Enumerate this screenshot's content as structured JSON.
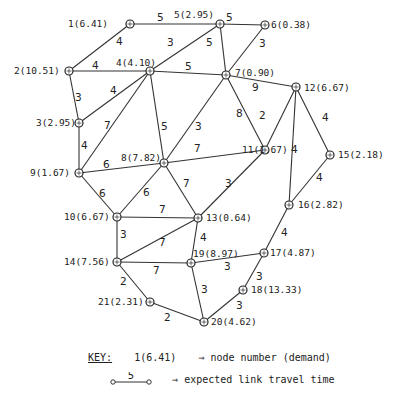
{
  "diagram": {
    "type": "network-graph",
    "nodes": [
      {
        "id": 1,
        "label": "1(6.41)",
        "demand": 6.41,
        "x": 130,
        "y": 24,
        "lx": 68,
        "ly": 27
      },
      {
        "id": 2,
        "label": "2(10.51)",
        "demand": 10.51,
        "x": 69,
        "y": 71,
        "lx": 14,
        "ly": 74
      },
      {
        "id": 3,
        "label": "3(2.95)",
        "demand": 2.95,
        "x": 79,
        "y": 123,
        "lx": 36,
        "ly": 126
      },
      {
        "id": 4,
        "label": "4(4.10)",
        "demand": 4.1,
        "x": 150,
        "y": 71,
        "lx": 116,
        "ly": 66
      },
      {
        "id": 5,
        "label": "5(2.95)",
        "demand": 2.95,
        "x": 220,
        "y": 24,
        "lx": 174,
        "ly": 18
      },
      {
        "id": 6,
        "label": "6(0.38)",
        "demand": 0.38,
        "x": 265,
        "y": 25,
        "lx": 271,
        "ly": 28
      },
      {
        "id": 7,
        "label": "7(0.90)",
        "demand": 0.9,
        "x": 226,
        "y": 75,
        "lx": 235,
        "ly": 76
      },
      {
        "id": 8,
        "label": "8(7.82)",
        "demand": 7.82,
        "x": 164,
        "y": 163,
        "lx": 121,
        "ly": 161
      },
      {
        "id": 9,
        "label": "9(1.67)",
        "demand": 1.67,
        "x": 79,
        "y": 173,
        "lx": 30,
        "ly": 176
      },
      {
        "id": 10,
        "label": "10(6.67)",
        "demand": 6.67,
        "x": 117,
        "y": 217,
        "lx": 64,
        "ly": 220
      },
      {
        "id": 11,
        "label": "11(1.67)",
        "demand": 1.67,
        "x": 265,
        "y": 150,
        "lx": 242,
        "ly": 153
      },
      {
        "id": 12,
        "label": "12(6.67)",
        "demand": 6.67,
        "x": 296,
        "y": 87,
        "lx": 304,
        "ly": 91
      },
      {
        "id": 13,
        "label": "13(0.64)",
        "demand": 0.64,
        "x": 198,
        "y": 218,
        "lx": 206,
        "ly": 221
      },
      {
        "id": 14,
        "label": "14(7.56)",
        "demand": 7.56,
        "x": 117,
        "y": 262,
        "lx": 64,
        "ly": 265
      },
      {
        "id": 15,
        "label": "15(2.18)",
        "demand": 2.18,
        "x": 330,
        "y": 155,
        "lx": 338,
        "ly": 158
      },
      {
        "id": 16,
        "label": "16(2.82)",
        "demand": 2.82,
        "x": 289,
        "y": 205,
        "lx": 298,
        "ly": 208
      },
      {
        "id": 17,
        "label": "17(4.87)",
        "demand": 4.87,
        "x": 264,
        "y": 253,
        "lx": 270,
        "ly": 256
      },
      {
        "id": 18,
        "label": "18(13.33)",
        "demand": 13.33,
        "x": 243,
        "y": 290,
        "lx": 251,
        "ly": 293
      },
      {
        "id": 19,
        "label": "19(8.97)",
        "demand": 8.97,
        "x": 191,
        "y": 263,
        "lx": 193,
        "ly": 257
      },
      {
        "id": 20,
        "label": "20(4.62)",
        "demand": 4.62,
        "x": 204,
        "y": 322,
        "lx": 211,
        "ly": 325
      },
      {
        "id": 21,
        "label": "21(2.31)",
        "demand": 2.31,
        "x": 150,
        "y": 302,
        "lx": 98,
        "ly": 305
      }
    ],
    "links": [
      {
        "from": 1,
        "to": 5,
        "time": 5,
        "tx": 157,
        "ty": 21
      },
      {
        "from": 1,
        "to": 2,
        "time": 4,
        "tx": 116,
        "ty": 45
      },
      {
        "from": 5,
        "to": 6,
        "time": 5,
        "tx": 226,
        "ty": 21
      },
      {
        "from": 5,
        "to": 4,
        "time": 3,
        "tx": 167,
        "ty": 46
      },
      {
        "from": 5,
        "to": 7,
        "time": 5,
        "tx": 206,
        "ty": 46
      },
      {
        "from": 6,
        "to": 7,
        "time": 3,
        "tx": 259,
        "ty": 47
      },
      {
        "from": 2,
        "to": 4,
        "time": 4,
        "tx": 92,
        "ty": 69
      },
      {
        "from": 4,
        "to": 7,
        "time": 5,
        "tx": 185,
        "ty": 70
      },
      {
        "from": 2,
        "to": 3,
        "time": 3,
        "tx": 75,
        "ty": 101
      },
      {
        "from": 4,
        "to": 3,
        "time": 4,
        "tx": 110,
        "ty": 94
      },
      {
        "from": 4,
        "to": 9,
        "time": 7,
        "tx": 104,
        "ty": 129
      },
      {
        "from": 4,
        "to": 8,
        "time": 5,
        "tx": 161,
        "ty": 130
      },
      {
        "from": 7,
        "to": 12,
        "time": 9,
        "tx": 252,
        "ty": 91
      },
      {
        "from": 7,
        "to": 8,
        "time": 3,
        "tx": 195,
        "ty": 130
      },
      {
        "from": 7,
        "to": 11,
        "time": 8,
        "tx": 236,
        "ty": 117
      },
      {
        "from": 12,
        "to": 11,
        "time": 2,
        "tx": 259,
        "ty": 119
      },
      {
        "from": 12,
        "to": 16,
        "time": 4,
        "tx": 291,
        "ty": 153
      },
      {
        "from": 12,
        "to": 15,
        "time": 4,
        "tx": 322,
        "ty": 121
      },
      {
        "from": 3,
        "to": 9,
        "time": 4,
        "tx": 81,
        "ty": 149
      },
      {
        "from": 9,
        "to": 8,
        "time": 6,
        "tx": 103,
        "ty": 168
      },
      {
        "from": 8,
        "to": 11,
        "time": 7,
        "tx": 194,
        "ty": 152
      },
      {
        "from": 9,
        "to": 10,
        "time": 6,
        "tx": 99,
        "ty": 197
      },
      {
        "from": 8,
        "to": 10,
        "time": 6,
        "tx": 143,
        "ty": 196
      },
      {
        "from": 8,
        "to": 13,
        "time": 7,
        "tx": 183,
        "ty": 187
      },
      {
        "from": 11,
        "to": 13,
        "time": 3,
        "tx": 225,
        "ty": 187
      },
      {
        "from": 15,
        "to": 16,
        "time": 4,
        "tx": 316,
        "ty": 181
      },
      {
        "from": 10,
        "to": 13,
        "time": 7,
        "tx": 159,
        "ty": 213
      },
      {
        "from": 10,
        "to": 14,
        "time": 3,
        "tx": 120,
        "ty": 238
      },
      {
        "from": 14,
        "to": 13,
        "time": 7,
        "tx": 159,
        "ty": 246
      },
      {
        "from": 13,
        "to": 19,
        "time": 4,
        "tx": 200,
        "ty": 241
      },
      {
        "from": 16,
        "to": 17,
        "time": 4,
        "tx": 281,
        "ty": 236
      },
      {
        "from": 14,
        "to": 19,
        "time": 7,
        "tx": 153,
        "ty": 274
      },
      {
        "from": 19,
        "to": 17,
        "time": 3,
        "tx": 224,
        "ty": 270
      },
      {
        "from": 17,
        "to": 18,
        "time": 3,
        "tx": 256,
        "ty": 280
      },
      {
        "from": 14,
        "to": 21,
        "time": 2,
        "tx": 120,
        "ty": 285
      },
      {
        "from": 19,
        "to": 20,
        "time": 3,
        "tx": 201,
        "ty": 293
      },
      {
        "from": 18,
        "to": 20,
        "time": 3,
        "tx": 236,
        "ty": 309
      },
      {
        "from": 21,
        "to": 20,
        "time": 2,
        "tx": 164,
        "ty": 321
      }
    ]
  },
  "key": {
    "title": "KEY:",
    "node_example": "1(6.41)",
    "node_arrow": "⇒",
    "node_desc": "node number (demand)",
    "link_example": "5",
    "link_arrow": "⇒",
    "link_desc": "expected link travel time"
  }
}
